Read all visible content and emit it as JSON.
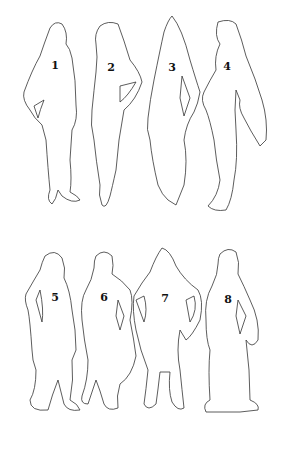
{
  "figures": [
    {
      "number": "1",
      "x": 55,
      "y": 60
    },
    {
      "number": "2",
      "x": 111,
      "y": 62
    },
    {
      "number": "3",
      "x": 172,
      "y": 62
    },
    {
      "number": "4",
      "x": 227,
      "y": 61
    },
    {
      "number": "5",
      "x": 55,
      "y": 292
    },
    {
      "number": "6",
      "x": 104,
      "y": 292
    },
    {
      "number": "7",
      "x": 165,
      "y": 293
    },
    {
      "number": "8",
      "x": 228,
      "y": 294
    }
  ],
  "colors": {
    "stroke": "#333333",
    "background": "#ffffff"
  }
}
